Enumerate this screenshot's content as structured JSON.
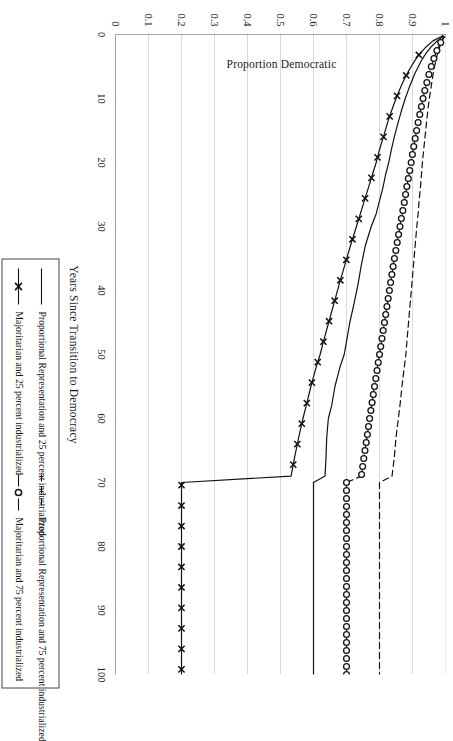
{
  "figure": {
    "background_color": "#ffffff",
    "ink_color": "#111111",
    "grid_color": "#cccccc",
    "axis_color": "#555555",
    "rotation_degrees": 90
  },
  "axes": {
    "x_title": "Years Since Transition to Democracy",
    "y_title": "Proportion Democratic",
    "x_ticks": [
      0,
      10,
      20,
      30,
      40,
      50,
      60,
      70,
      80,
      90,
      100
    ],
    "x_tick_labels": [
      "0",
      "10",
      "20",
      "30",
      "40",
      "50",
      "60",
      "70",
      "80",
      "90",
      "100"
    ],
    "y_ticks": [
      0,
      0.1,
      0.2,
      0.3,
      0.4,
      0.5,
      0.6,
      0.7,
      0.8,
      0.9,
      1
    ],
    "y_tick_labels": [
      "0",
      "0.1",
      "0.2",
      "0.3",
      "0.4",
      "0.5",
      "0.6",
      "0.7",
      "0.8",
      "0.9",
      "1"
    ],
    "xlim": [
      0,
      100
    ],
    "ylim": [
      0,
      1
    ],
    "grid": "horizontal-only"
  },
  "legend": {
    "position": "below-axes",
    "entries": [
      {
        "label": "Proportional Representation and 25 percent industrialized",
        "style": "solid",
        "marker": "none"
      },
      {
        "label": "Proportional Representation and 75 percent industrialized",
        "style": "dashed",
        "marker": "none"
      },
      {
        "label": "Majoritarian and 25 percent industrialized",
        "style": "solid",
        "marker": "x"
      },
      {
        "label": "Majoritarian and 75 percent industrialized",
        "style": "dashed",
        "marker": "circle"
      }
    ]
  },
  "chart_data": {
    "type": "line",
    "title": "",
    "subtitle": "",
    "xlabel": "Years Since Transition to Democracy",
    "ylabel": "Proportion Democratic",
    "xlim": [
      0,
      100
    ],
    "ylim": [
      0,
      1
    ],
    "grid": true,
    "legend_position": "bottom",
    "x": [
      0,
      1,
      2,
      3,
      4,
      5,
      6,
      7,
      8,
      9,
      10,
      12,
      14,
      16,
      18,
      20,
      22,
      24,
      26,
      28,
      30,
      33,
      36,
      39,
      42,
      45,
      48,
      50,
      52,
      55,
      58,
      60,
      63,
      66,
      69,
      70,
      72,
      75,
      80,
      85,
      90,
      95,
      100
    ],
    "series": [
      {
        "name": "Proportional Representation and 25 percent industrialized",
        "style": "solid",
        "marker": "none",
        "values": [
          1.0,
          0.975,
          0.955,
          0.94,
          0.928,
          0.918,
          0.908,
          0.9,
          0.892,
          0.885,
          0.878,
          0.866,
          0.855,
          0.845,
          0.836,
          0.828,
          0.818,
          0.81,
          0.8,
          0.79,
          0.775,
          0.757,
          0.745,
          0.735,
          0.723,
          0.71,
          0.7,
          0.693,
          0.68,
          0.665,
          0.655,
          0.645,
          0.64,
          0.638,
          0.635,
          0.6,
          0.6,
          0.6,
          0.6,
          0.6,
          0.6,
          0.6,
          0.6
        ]
      },
      {
        "name": "Proportional Representation and 75 percent industrialized",
        "style": "dashed",
        "marker": "none",
        "values": [
          1.0,
          0.99,
          0.982,
          0.976,
          0.971,
          0.967,
          0.963,
          0.96,
          0.957,
          0.954,
          0.951,
          0.946,
          0.942,
          0.938,
          0.934,
          0.93,
          0.927,
          0.924,
          0.92,
          0.917,
          0.913,
          0.908,
          0.903,
          0.898,
          0.893,
          0.888,
          0.883,
          0.88,
          0.875,
          0.868,
          0.862,
          0.857,
          0.85,
          0.845,
          0.838,
          0.8,
          0.8,
          0.8,
          0.8,
          0.8,
          0.8,
          0.8,
          0.8
        ]
      },
      {
        "name": "Majoritarian and 25 percent industrialized",
        "style": "solid",
        "marker": "x",
        "values": [
          1.0,
          0.962,
          0.94,
          0.922,
          0.908,
          0.896,
          0.885,
          0.875,
          0.866,
          0.858,
          0.85,
          0.836,
          0.823,
          0.812,
          0.8,
          0.79,
          0.778,
          0.766,
          0.754,
          0.742,
          0.73,
          0.712,
          0.695,
          0.678,
          0.662,
          0.646,
          0.63,
          0.62,
          0.608,
          0.592,
          0.578,
          0.568,
          0.555,
          0.543,
          0.532,
          0.2,
          0.2,
          0.2,
          0.2,
          0.2,
          0.2,
          0.2,
          0.2
        ]
      },
      {
        "name": "Majoritarian and 75 percent industrialized",
        "style": "dashed",
        "marker": "circle",
        "values": [
          1.0,
          0.988,
          0.978,
          0.97,
          0.963,
          0.957,
          0.951,
          0.946,
          0.941,
          0.936,
          0.932,
          0.924,
          0.916,
          0.909,
          0.902,
          0.896,
          0.889,
          0.882,
          0.876,
          0.869,
          0.862,
          0.852,
          0.842,
          0.833,
          0.824,
          0.815,
          0.806,
          0.8,
          0.794,
          0.785,
          0.776,
          0.77,
          0.762,
          0.753,
          0.745,
          0.7,
          0.7,
          0.7,
          0.7,
          0.7,
          0.7,
          0.7,
          0.7
        ]
      }
    ]
  }
}
